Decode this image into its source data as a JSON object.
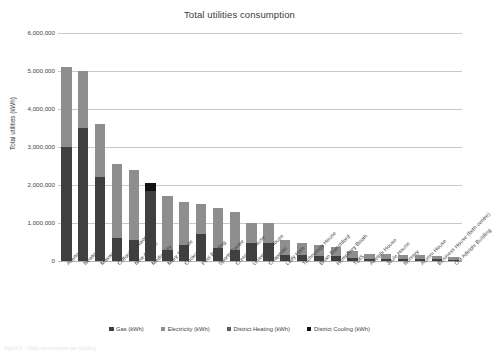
{
  "chart_data": {
    "type": "bar",
    "subtype": "stacked-column",
    "title": "Total utilities consumption",
    "xlabel": "",
    "ylabel": "Total utilities (kWh)",
    "ylim": [
      0,
      6000000
    ],
    "ytick_values": [
      0,
      1000000,
      2000000,
      3000000,
      4000000,
      5000000,
      6000000
    ],
    "ytick_labels": [
      "0",
      "1,000,000",
      "2,000,000",
      "3,000,000",
      "4,000,000",
      "5,000,000",
      "6,000,000"
    ],
    "grid": true,
    "legend_position": "bottom",
    "categories": [
      "Allerton",
      "Newton",
      "Maxwell",
      "Clifford Whitworth",
      "New Adelphi",
      "Media City",
      "Mary Seacole",
      "Cockcroft",
      "Peel Building",
      "Sports Centre",
      "Crescent House",
      "University House",
      "Chapman",
      "Lady Hale",
      "Technology House",
      "Brian Blanchford",
      "Humphrey Booth",
      "TDfS",
      "Adelphi House",
      "Joule House",
      "Nursery",
      "Alumni House",
      "Business House (faith centre)",
      "Old Adelphi Building"
    ],
    "series": [
      {
        "name": "Gas (kWh)",
        "color": "#3f3f3f",
        "values": [
          3000000,
          3500000,
          2200000,
          600000,
          550000,
          1850000,
          300000,
          430000,
          700000,
          330000,
          300000,
          480000,
          470000,
          170000,
          150000,
          140000,
          120000,
          85000,
          55000,
          60000,
          50000,
          45000,
          40000,
          35000
        ]
      },
      {
        "name": "Electricity (kWh)",
        "color": "#8e8e8e",
        "values": [
          2100000,
          1500000,
          1400000,
          1950000,
          1850000,
          0,
          1400000,
          1120000,
          800000,
          1070000,
          1000000,
          520000,
          520000,
          380000,
          330000,
          270000,
          250000,
          180000,
          140000,
          120000,
          110000,
          105000,
          90000,
          80000
        ]
      },
      {
        "name": "District Heating (kWh)",
        "color": "#5c5c5c",
        "values": [
          0,
          0,
          0,
          0,
          0,
          0,
          0,
          0,
          0,
          0,
          0,
          0,
          0,
          0,
          0,
          0,
          0,
          0,
          0,
          0,
          0,
          0,
          0,
          0
        ]
      },
      {
        "name": "District Cooling (kWh)",
        "color": "#111111",
        "values": [
          0,
          0,
          0,
          0,
          0,
          200000,
          0,
          0,
          0,
          0,
          0,
          0,
          0,
          0,
          0,
          0,
          0,
          0,
          0,
          0,
          0,
          0,
          0,
          0
        ]
      }
    ],
    "totals": [
      5100000,
      5000000,
      3600000,
      2550000,
      2400000,
      2050000,
      1700000,
      1550000,
      1500000,
      1400000,
      1300000,
      1000000,
      990000,
      550000,
      480000,
      410000,
      370000,
      265000,
      195000,
      180000,
      160000,
      150000,
      130000,
      115000
    ]
  },
  "legend": {
    "items": [
      {
        "label": "Gas (kWh)",
        "color": "#3f3f3f"
      },
      {
        "label": "Electricity (kWh)",
        "color": "#8e8e8e"
      },
      {
        "label": "District Heating (kWh)",
        "color": "#5c5c5c"
      },
      {
        "label": "District Cooling (kWh)",
        "color": "#111111"
      }
    ]
  },
  "caption": {
    "text": "Figure 5 - Utility consumption per building"
  }
}
